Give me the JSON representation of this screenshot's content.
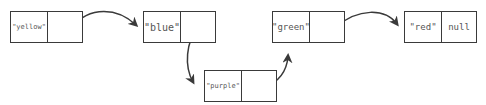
{
  "diagram": {
    "type": "linked-list",
    "nodes": [
      {
        "id": "yellow",
        "value": "\"yellow\"",
        "next": "blue"
      },
      {
        "id": "blue",
        "value": "\"blue\"",
        "next": "purple"
      },
      {
        "id": "purple",
        "value": "\"purple\"",
        "next": "green"
      },
      {
        "id": "green",
        "value": "\"green\"",
        "next": "red"
      },
      {
        "id": "red",
        "value": "\"red\"",
        "next_label": "null"
      }
    ],
    "stroke_color": "#3a3a3a",
    "text_color": "#555555"
  }
}
